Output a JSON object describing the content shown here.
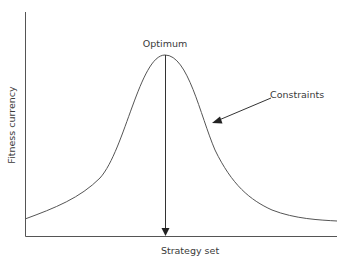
{
  "diagram": {
    "type": "fitness-landscape",
    "axes": {
      "y_label": "Fitness currency",
      "x_label": "Strategy set"
    },
    "annotations": {
      "optimum": "Optimum",
      "constraints": "Constraints"
    },
    "colors": {
      "line": "#555555",
      "text": "#3a3a3a",
      "background": "#ffffff"
    }
  }
}
